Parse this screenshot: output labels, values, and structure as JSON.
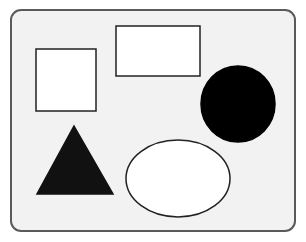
{
  "diagram": {
    "title": "",
    "frame": {
      "x": 11,
      "y": 10,
      "width": 284,
      "height": 221,
      "rx": 10,
      "fill": "#f2f2f2",
      "stroke": "#5a5a5a",
      "stroke_width": 2
    },
    "shapes": [
      {
        "id": "square",
        "type": "square",
        "fill": "#ffffff",
        "stroke": "#222222",
        "x": 36,
        "y": 49,
        "width": 60,
        "height": 62
      },
      {
        "id": "rectangle",
        "type": "rectangle",
        "fill": "#ffffff",
        "stroke": "#222222",
        "x": 116,
        "y": 26,
        "width": 84,
        "height": 50
      },
      {
        "id": "circle",
        "type": "circle",
        "fill": "#000000",
        "stroke": "#000000",
        "cx": 238,
        "cy": 104,
        "rx": 37,
        "ry": 38
      },
      {
        "id": "triangle",
        "type": "triangle",
        "fill": "#111111",
        "stroke": "#111111",
        "points": "74,126 113,194 37,194"
      },
      {
        "id": "ellipse",
        "type": "ellipse",
        "fill": "#ffffff",
        "stroke": "#222222",
        "cx": 178,
        "cy": 178.5,
        "rx": 52,
        "ry": 38.5
      }
    ]
  }
}
